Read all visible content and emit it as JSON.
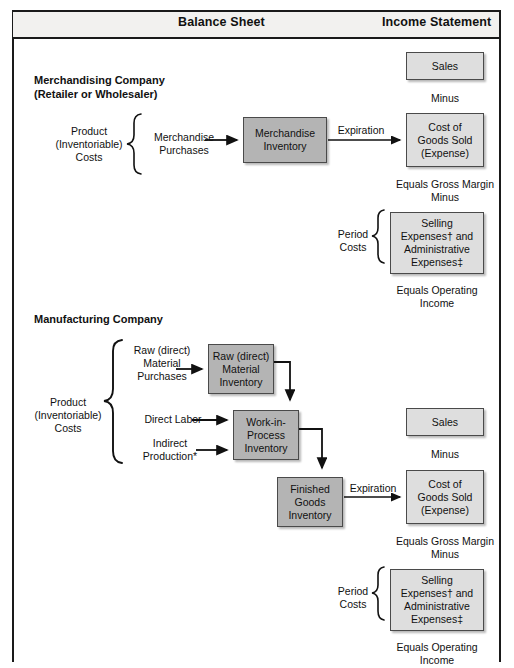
{
  "header": {
    "balance_sheet": "Balance Sheet",
    "income_statement": "Income Statement"
  },
  "merchandising": {
    "heading_line1": "Merchandising Company",
    "heading_line2": "(Retailer or Wholesaler)",
    "product_costs_l1": "Product",
    "product_costs_l2": "(Inventoriable)",
    "product_costs_l3": "Costs",
    "merchandise_purchases_l1": "Merchandise",
    "merchandise_purchases_l2": "Purchases",
    "merchandise_inventory_l1": "Merchandise",
    "merchandise_inventory_l2": "Inventory",
    "expiration": "Expiration",
    "sales": "Sales",
    "minus_1": "Minus",
    "cogs_l1": "Cost of",
    "cogs_l2": "Goods Sold",
    "cogs_l3": "(Expense)",
    "equals_gross_margin": "Equals Gross Margin",
    "minus_2": "Minus",
    "period_costs_l1": "Period",
    "period_costs_l2": "Costs",
    "sga_l1": "Selling",
    "sga_l2": "Expenses† and",
    "sga_l3": "Administrative",
    "sga_l4": "Expenses‡",
    "equals_operating_l1": "Equals Operating",
    "equals_operating_l2": "Income"
  },
  "manufacturing": {
    "heading": "Manufacturing Company",
    "product_costs_l1": "Product",
    "product_costs_l2": "(Inventoriable)",
    "product_costs_l3": "Costs",
    "raw_purchases_l1": "Raw (direct)",
    "raw_purchases_l2": "Material",
    "raw_purchases_l3": "Purchases",
    "raw_inventory_l1": "Raw (direct)",
    "raw_inventory_l2": "Material",
    "raw_inventory_l3": "Inventory",
    "direct_labor": "Direct Labor",
    "indirect_production_l1": "Indirect",
    "indirect_production_l2": "Production*",
    "wip_l1": "Work-in-",
    "wip_l2": "Process",
    "wip_l3": "Inventory",
    "finished_goods_l1": "Finished",
    "finished_goods_l2": "Goods",
    "finished_goods_l3": "Inventory",
    "expiration": "Expiration",
    "sales": "Sales",
    "minus_1": "Minus",
    "cogs_l1": "Cost of",
    "cogs_l2": "Goods Sold",
    "cogs_l3": "(Expense)",
    "equals_gross_margin": "Equals Gross Margin",
    "minus_2": "Minus",
    "period_costs_l1": "Period",
    "period_costs_l2": "Costs",
    "sga_l1": "Selling",
    "sga_l2": "Expenses† and",
    "sga_l3": "Administrative",
    "sga_l4": "Expenses‡",
    "equals_operating_l1": "Equals Operating",
    "equals_operating_l2": "Income"
  },
  "colors": {
    "box_dark": "#b4b4b4",
    "box_light": "#dedede",
    "rule": "#1a1a1a",
    "header_band": "#f2f1ef"
  }
}
